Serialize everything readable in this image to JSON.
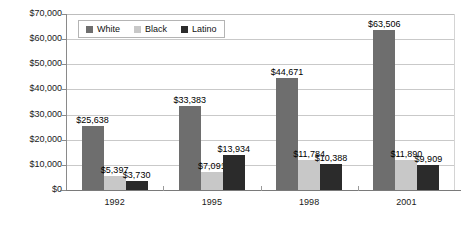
{
  "chart_data": {
    "type": "bar",
    "title": "",
    "subtitle": "",
    "xlabel": "",
    "ylabel": "",
    "categories": [
      "1992",
      "1995",
      "1998",
      "2001"
    ],
    "series": [
      {
        "name": "White",
        "color": "#6e6e6e",
        "values": [
          25638,
          33383,
          44671,
          63506
        ],
        "labels": [
          "$25,638",
          "$33,383",
          "$44,671",
          "$63,506"
        ]
      },
      {
        "name": "Black",
        "color": "#c8c8c8",
        "values": [
          5397,
          7091,
          11784,
          11890
        ],
        "labels": [
          "$5,397",
          "$7,091",
          "$11,784",
          "$11,890"
        ]
      },
      {
        "name": "Latino",
        "color": "#2b2b2b",
        "values": [
          3730,
          13934,
          10388,
          9909
        ],
        "labels": [
          "$3,730",
          "$13,934",
          "$10,388",
          "$9,909"
        ]
      }
    ],
    "ylim": [
      0,
      70000
    ],
    "ytick_values": [
      0,
      10000,
      20000,
      30000,
      40000,
      50000,
      60000,
      70000
    ],
    "ytick_labels": [
      "$0",
      "$10,000",
      "$20,000",
      "$30,000",
      "$40,000",
      "$50,000",
      "$60,000",
      "$70,000"
    ],
    "grid": true,
    "legend_position": "top-left-inside",
    "legend_entries": [
      "White",
      "Black",
      "Latino"
    ]
  },
  "axes": {
    "y_ticks": [
      {
        "label": "$70,000",
        "value": 70000
      },
      {
        "label": "$60,000",
        "value": 60000
      },
      {
        "label": "$50,000",
        "value": 50000
      },
      {
        "label": "$40,000",
        "value": 40000
      },
      {
        "label": "$30,000",
        "value": 30000
      },
      {
        "label": "$20,000",
        "value": 20000
      },
      {
        "label": "$10,000",
        "value": 10000
      },
      {
        "label": "$0",
        "value": 0
      }
    ],
    "x_ticks": [
      {
        "label": "1992"
      },
      {
        "label": "1995"
      },
      {
        "label": "1998"
      },
      {
        "label": "2001"
      }
    ]
  },
  "legend": {
    "items": [
      {
        "label": "White",
        "color": "#6e6e6e",
        "swatch": "square-swatch-white-series"
      },
      {
        "label": "Black",
        "color": "#c8c8c8",
        "swatch": "square-swatch-black-series"
      },
      {
        "label": "Latino",
        "color": "#2b2b2b",
        "swatch": "square-swatch-latino-series"
      }
    ]
  },
  "colors": {
    "series_white": "#6e6e6e",
    "series_black": "#c8c8c8",
    "series_latino": "#2b2b2b",
    "gridline": "#c9c9c9",
    "axis": "#8a8a8a",
    "text": "#1a1a1a",
    "background": "#ffffff"
  }
}
